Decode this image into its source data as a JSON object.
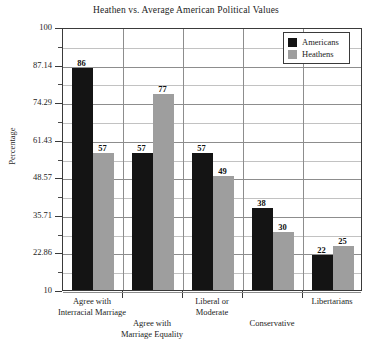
{
  "chart_data": {
    "type": "bar",
    "title": "Heathen vs. Average American Political Values",
    "xlabel": "",
    "ylabel": "Percentage",
    "ylim": [
      10,
      100
    ],
    "ytick_labels": [
      "100",
      "87.14",
      "74.29",
      "61.43",
      "48.57",
      "35.71",
      "22.86",
      "10"
    ],
    "ytick_values": [
      100,
      87.14,
      74.29,
      61.43,
      48.57,
      35.71,
      22.86,
      10
    ],
    "grid": true,
    "legend_position": "top-right",
    "categories": [
      "Agree with\nInterracial Marriage",
      "Agree with\nMarriage Equality",
      "Liberal or\nModerate",
      "Conservative",
      "Libertarians"
    ],
    "category_lines": [
      [
        "Agree with",
        "Interracial Marriage"
      ],
      [
        "Agree with",
        "Marriage Equality"
      ],
      [
        "Liberal or",
        "Moderate"
      ],
      [
        "Conservative"
      ],
      [
        "Libertarians"
      ]
    ],
    "series": [
      {
        "name": "Americans",
        "color": "#141414",
        "values": [
          86,
          57,
          57,
          38,
          22
        ]
      },
      {
        "name": "Heathens",
        "color": "#9e9e9e",
        "values": [
          57,
          77,
          49,
          30,
          25
        ]
      }
    ]
  },
  "legend": {
    "items": [
      {
        "label": "Americans"
      },
      {
        "label": "Heathens"
      }
    ]
  }
}
